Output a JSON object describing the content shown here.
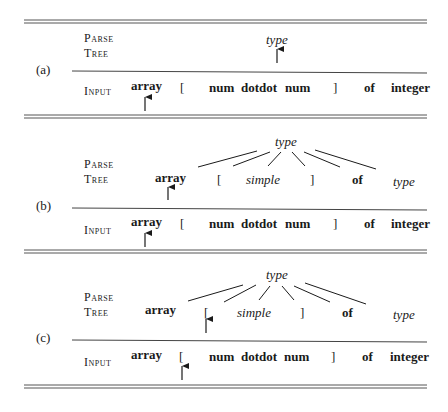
{
  "colors": {
    "ink": "#1a1a1a",
    "rule": "#555555",
    "background": "#ffffff"
  },
  "row_labels": {
    "parse_tree": [
      "Parse",
      "Tree"
    ],
    "input": "Input"
  },
  "panels": [
    {
      "label": "(a)",
      "parse_tree": {
        "root": "type",
        "children": [],
        "lookahead_arrow_on": "type"
      },
      "input": {
        "tokens": [
          "array",
          "[",
          "num",
          "dotdot",
          "num",
          "]",
          "of",
          "integer"
        ],
        "lookahead_index": 0
      }
    },
    {
      "label": "(b)",
      "parse_tree": {
        "root": "type",
        "children": [
          "array",
          "[",
          "simple",
          "]",
          "of",
          "type"
        ],
        "lookahead_arrow_on": "array"
      },
      "input": {
        "tokens": [
          "array",
          "[",
          "num",
          "dotdot",
          "num",
          "]",
          "of",
          "integer"
        ],
        "lookahead_index": 0
      }
    },
    {
      "label": "(c)",
      "parse_tree": {
        "root": "type",
        "children": [
          "array",
          "[",
          "simple",
          "]",
          "of",
          "type"
        ],
        "lookahead_arrow_on": "["
      },
      "input": {
        "tokens": [
          "array",
          "[",
          "num",
          "dotdot",
          "num",
          "]",
          "of",
          "integer"
        ],
        "lookahead_index": 1
      }
    }
  ]
}
